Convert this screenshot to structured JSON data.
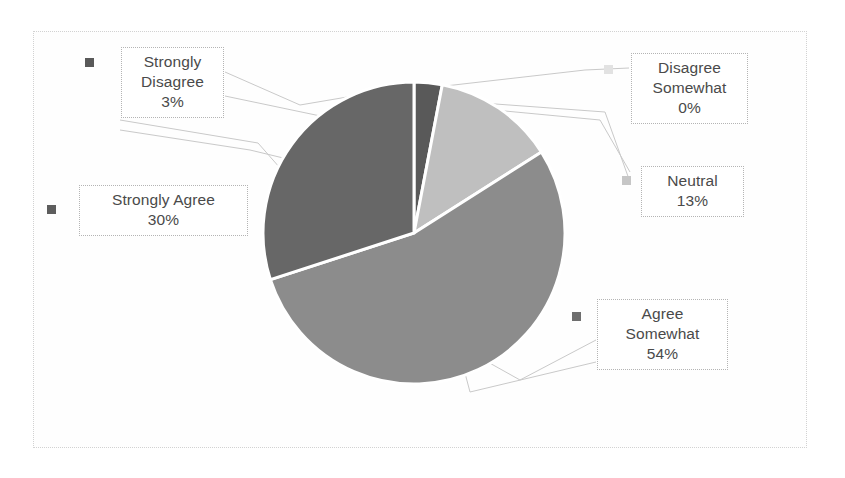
{
  "chart_data": {
    "type": "pie",
    "title": "",
    "subtitle": "",
    "xlabel": "",
    "ylabel": "",
    "grid": false,
    "legend_position": "data-labels-with-leader-lines",
    "start_angle_deg": 0,
    "direction": "clockwise",
    "categories": [
      "Strongly Disagree",
      "Disagree Somewhat",
      "Neutral",
      "Agree Somewhat",
      "Strongly Agree"
    ],
    "values": [
      3,
      0,
      13,
      54,
      30
    ],
    "value_unit": "percent",
    "slices": [
      {
        "label": "Strongly Disagree",
        "value": 3,
        "value_text": "3%",
        "color": "#595959",
        "marker_color": "#595959",
        "label_line1": "Strongly",
        "label_line2": "Disagree",
        "label_pct": "3%"
      },
      {
        "label": "Disagree Somewhat",
        "value": 0,
        "value_text": "0%",
        "color": "#a6a6a6",
        "marker_color": "#e2e2e2",
        "label_line1": "Disagree",
        "label_line2": "Somewhat",
        "label_pct": "0%"
      },
      {
        "label": "Neutral",
        "value": 13,
        "value_text": "13%",
        "color": "#bfbfbf",
        "marker_color": "#c6c6c6",
        "label_line1": "Neutral",
        "label_line2": "",
        "label_pct": "13%"
      },
      {
        "label": "Agree Somewhat",
        "value": 54,
        "value_text": "54%",
        "color": "#8c8c8c",
        "marker_color": "#6e6e6e",
        "label_line1": "Agree",
        "label_line2": "Somewhat",
        "label_pct": "54%"
      },
      {
        "label": "Strongly Agree",
        "value": 30,
        "value_text": "30%",
        "color": "#676767",
        "marker_color": "#5d5d5d",
        "label_line1": "Strongly Agree",
        "label_line2": "",
        "label_pct": "30%"
      }
    ],
    "slice_separator_color": "#ffffff",
    "leader_line_color": "#c9c9c9",
    "plot_area_border_color": "#d2d2d2",
    "background_color": "#ffffff"
  },
  "geometry": {
    "center_x": 414,
    "center_y": 233,
    "radius": 151
  }
}
